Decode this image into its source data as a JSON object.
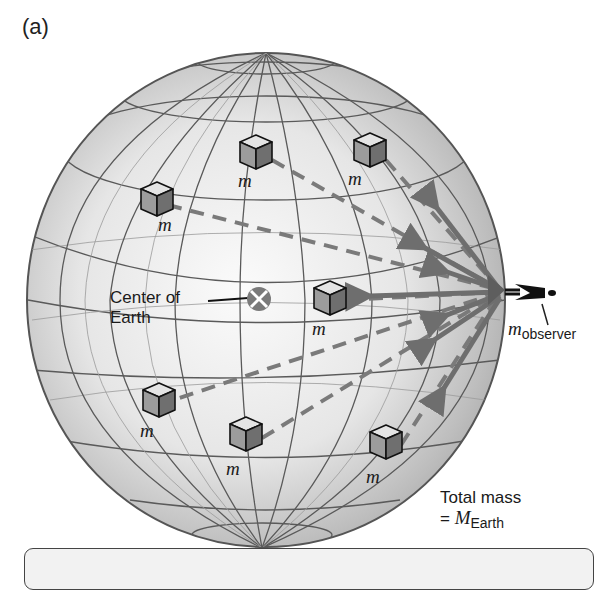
{
  "figure": {
    "panel_label": "(a)",
    "center_label": [
      "Center of",
      "Earth"
    ],
    "mass_label": "m",
    "observer_label": {
      "symbol": "m",
      "subscript": "observer"
    },
    "total_mass": {
      "line1": "Total mass",
      "prefix": "= ",
      "symbol": "M",
      "subscript": "Earth"
    },
    "mass_blocks": [
      {
        "x": 256,
        "y": 150,
        "label_x": 240,
        "label_y": 175
      },
      {
        "x": 370,
        "y": 148,
        "label_x": 350,
        "label_y": 173
      },
      {
        "x": 153,
        "y": 195,
        "label_x": 158,
        "label_y": 220
      },
      {
        "x": 330,
        "y": 298,
        "label_x": 312,
        "label_y": 322
      },
      {
        "x": 143,
        "y": 400,
        "label_x": 140,
        "label_y": 425
      },
      {
        "x": 246,
        "y": 433,
        "label_x": 228,
        "label_y": 460
      },
      {
        "x": 386,
        "y": 440,
        "label_x": 368,
        "label_y": 468
      }
    ],
    "colors": {
      "sphere_light": "#f5f5f5",
      "sphere_dark": "#9a9a9a",
      "grid": "#5a5a5a",
      "arrow": "#6e6e6e",
      "dash": "#7a7a7a",
      "block_left": "#9c9c9c",
      "block_right": "#6f6f6f",
      "block_top": "#e4e4e4"
    }
  }
}
